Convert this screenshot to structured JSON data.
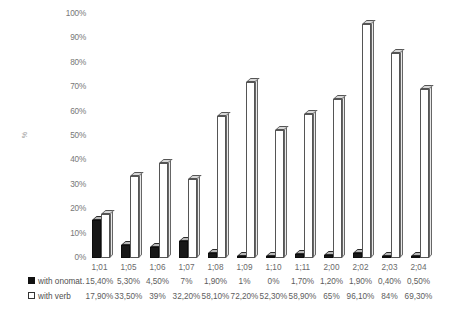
{
  "chart_data": {
    "type": "bar",
    "title": "",
    "subtitle": "",
    "xlabel": "",
    "ylabel": "%",
    "ylim": [
      0,
      100
    ],
    "ytick_labels": [
      "100%",
      "90%",
      "80%",
      "70%",
      "60%",
      "50%",
      "40%",
      "30%",
      "20%",
      "10%",
      "0%"
    ],
    "ytick_values": [
      100,
      90,
      80,
      70,
      60,
      50,
      40,
      30,
      20,
      10,
      0
    ],
    "grid": false,
    "legend_position": "bottom-table",
    "categories": [
      "1;01",
      "1;05",
      "1;06",
      "1;07",
      "1;08",
      "1;09",
      "1;10",
      "1;11",
      "2;00",
      "2;02",
      "2;03",
      "2;04"
    ],
    "series": [
      {
        "name": "with onomat.",
        "color": "#181818",
        "marker": "filled-square",
        "values": [
          15.4,
          5.3,
          4.5,
          7.0,
          1.9,
          1.0,
          0.0,
          1.7,
          1.2,
          1.9,
          0.4,
          0.5
        ],
        "labels": [
          "15,40%",
          "5,30%",
          "4,50%",
          "7%",
          "1,90%",
          "1%",
          "0%",
          "1,70%",
          "1,20%",
          "1,90%",
          "0,40%",
          "0,50%"
        ]
      },
      {
        "name": "with verb",
        "color": "#ffffff",
        "marker": "open-square",
        "values": [
          17.9,
          33.5,
          39.0,
          32.2,
          58.1,
          72.2,
          52.3,
          58.9,
          65.0,
          96.1,
          84.0,
          69.3
        ],
        "labels": [
          "17,90%",
          "33,50%",
          "39%",
          "32,20%",
          "58,10%",
          "72,20%",
          "52,30%",
          "58,90%",
          "65%",
          "96,10%",
          "84%",
          "69,30%"
        ]
      }
    ]
  },
  "axis": {
    "y_title": "%"
  },
  "legend": {
    "onomat_label": "with onomat.",
    "verb_label": "with verb"
  }
}
